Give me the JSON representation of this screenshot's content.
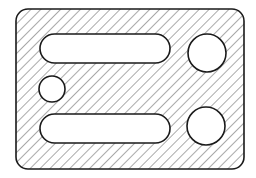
{
  "diagram": {
    "type": "hatched-section-plate",
    "colors": {
      "stroke": "#1a1a1a",
      "hatch": "#555555",
      "background": "#ffffff",
      "fill": "#ffffff"
    },
    "plate": {
      "x": 16,
      "y": 9,
      "width": 228,
      "height": 160,
      "corner_radius": 12
    },
    "slots": [
      {
        "id": "top-slot",
        "x": 40,
        "y": 34,
        "width": 130,
        "height": 29
      },
      {
        "id": "bottom-slot",
        "x": 40,
        "y": 114,
        "width": 130,
        "height": 29
      }
    ],
    "holes": [
      {
        "id": "left-small-hole",
        "cx": 52,
        "cy": 89,
        "r": 13
      },
      {
        "id": "top-right-hole",
        "cx": 207,
        "cy": 53,
        "r": 19
      },
      {
        "id": "bottom-right-hole",
        "cx": 206,
        "cy": 126,
        "r": 19
      }
    ]
  }
}
